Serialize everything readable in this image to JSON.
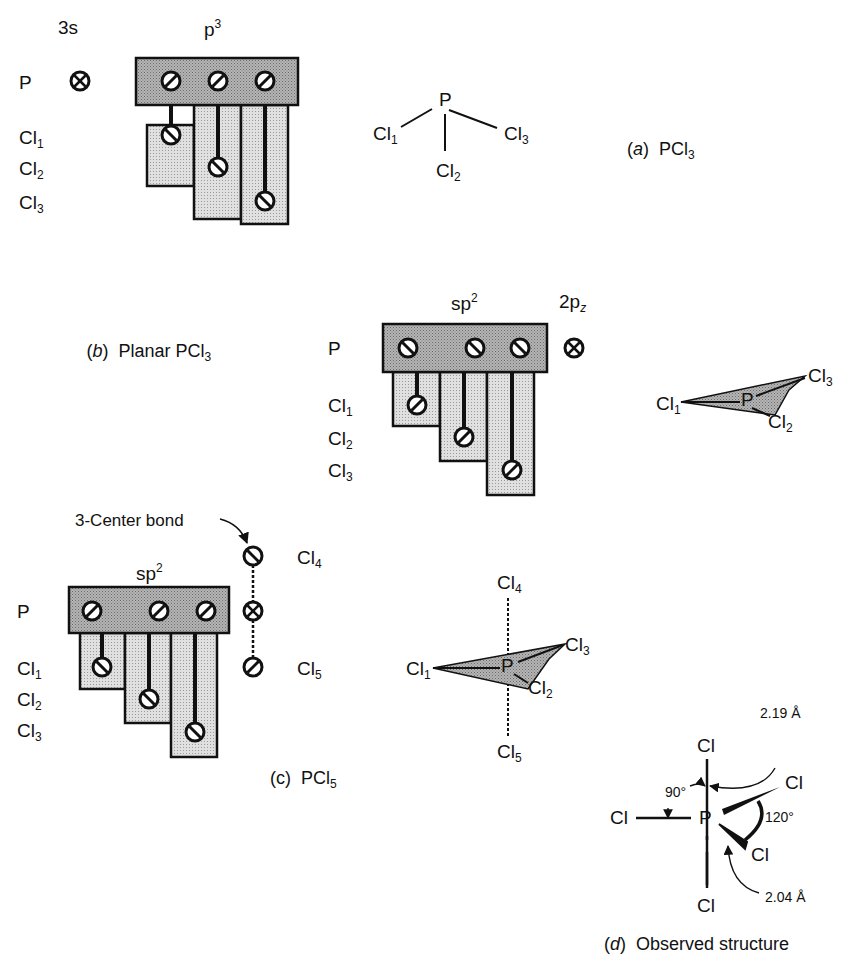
{
  "figure": {
    "panel_a": {
      "caption_letter": "a",
      "caption_text": "PCl",
      "caption_sub": "3",
      "header_s": "3s",
      "header_p": "p",
      "header_p_sup": "3",
      "row_labels": [
        {
          "base": "P",
          "sub": ""
        },
        {
          "base": "Cl",
          "sub": "1"
        },
        {
          "base": "Cl",
          "sub": "2"
        },
        {
          "base": "Cl",
          "sub": "3"
        }
      ],
      "structure": {
        "center": "P",
        "atoms": [
          {
            "base": "Cl",
            "sub": "1"
          },
          {
            "base": "Cl",
            "sub": "2"
          },
          {
            "base": "Cl",
            "sub": "3"
          }
        ]
      }
    },
    "panel_b": {
      "caption_letter": "b",
      "caption_text": "Planar PCl",
      "caption_sub": "3",
      "header_sp": "sp",
      "header_sp_sup": "2",
      "header_pz": "2p",
      "header_pz_sub": "z",
      "row_labels": [
        {
          "base": "P",
          "sub": ""
        },
        {
          "base": "Cl",
          "sub": "1"
        },
        {
          "base": "Cl",
          "sub": "2"
        },
        {
          "base": "Cl",
          "sub": "3"
        }
      ],
      "structure": {
        "center": "P",
        "atoms": [
          {
            "base": "Cl",
            "sub": "1"
          },
          {
            "base": "Cl",
            "sub": "2"
          },
          {
            "base": "Cl",
            "sub": "3"
          }
        ]
      }
    },
    "panel_c": {
      "caption_letter": "c",
      "caption_text": "PCl",
      "caption_sub": "5",
      "annotation": "3-Center bond",
      "header_sp": "sp",
      "header_sp_sup": "2",
      "row_labels": [
        {
          "base": "P",
          "sub": ""
        },
        {
          "base": "Cl",
          "sub": "1"
        },
        {
          "base": "Cl",
          "sub": "2"
        },
        {
          "base": "Cl",
          "sub": "3"
        }
      ],
      "axial_labels": [
        {
          "base": "Cl",
          "sub": "4"
        },
        {
          "base": "Cl",
          "sub": "5"
        }
      ],
      "structure": {
        "center": "P",
        "atoms": [
          {
            "base": "Cl",
            "sub": "1"
          },
          {
            "base": "Cl",
            "sub": "2"
          },
          {
            "base": "Cl",
            "sub": "3"
          },
          {
            "base": "Cl",
            "sub": "4"
          },
          {
            "base": "Cl",
            "sub": "5"
          }
        ]
      }
    },
    "panel_d": {
      "caption_letter": "d",
      "caption_text": "Observed structure",
      "center": "P",
      "atom": "Cl",
      "axial_bond_length": "2.19 Å",
      "equatorial_bond_length": "2.04 Å",
      "angle_axial": "90°",
      "angle_equatorial": "120°"
    }
  },
  "colors": {
    "p_box": "#a9a9a9",
    "cl_box": "#d6d6d6",
    "stroke": "#111111",
    "triangle": "#7a7a7a"
  }
}
